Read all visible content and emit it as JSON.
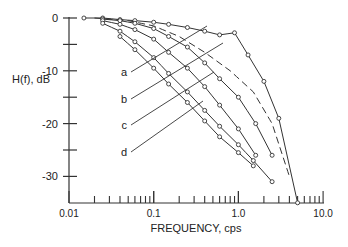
{
  "chart_data": {
    "type": "line",
    "title": "",
    "xlabel": "FREQUENCY, cps",
    "ylabel": "H(f), dB",
    "xscale": "log",
    "xlim": [
      0.01,
      10.0
    ],
    "ylim": [
      -35,
      0
    ],
    "x_ticks": [
      "0.01",
      "0.1",
      "1.0",
      "10.0"
    ],
    "y_ticks": [
      "0",
      "-10",
      "-20",
      "-30"
    ],
    "grid": false,
    "legend": "curve labels a, b, c, d with leader lines",
    "series": [
      {
        "name": "top (solid, peak near 1.0)",
        "style": "solid-markers",
        "x": [
          0.015,
          0.025,
          0.04,
          0.06,
          0.1,
          0.15,
          0.25,
          0.4,
          0.6,
          0.9,
          1.3,
          2.0,
          3.0,
          5.0
        ],
        "y": [
          0,
          0,
          -0.3,
          -0.5,
          -0.8,
          -1.2,
          -1.8,
          -2.5,
          -3.2,
          -2.8,
          -7,
          -12,
          -19,
          -35
        ]
      },
      {
        "name": "dashed",
        "style": "dashed",
        "x": [
          0.02,
          0.05,
          0.1,
          0.2,
          0.4,
          0.8,
          1.5,
          2.5,
          4.0
        ],
        "y": [
          0,
          -0.5,
          -1.5,
          -3.5,
          -6.5,
          -10,
          -14,
          -20,
          -30
        ]
      },
      {
        "name": "a",
        "style": "solid-markers",
        "x": [
          0.025,
          0.04,
          0.06,
          0.1,
          0.15,
          0.25,
          0.4,
          0.6,
          1.0,
          1.6,
          2.5
        ],
        "y": [
          -0.2,
          -0.5,
          -1,
          -2,
          -3.5,
          -5.5,
          -8.5,
          -11.5,
          -15,
          -20,
          -26
        ]
      },
      {
        "name": "b",
        "style": "solid-markers",
        "x": [
          0.025,
          0.04,
          0.06,
          0.1,
          0.15,
          0.25,
          0.4,
          0.6,
          1.0,
          1.6
        ],
        "y": [
          -0.5,
          -1.2,
          -2.2,
          -4,
          -6.5,
          -9.5,
          -13,
          -16.5,
          -21,
          -26
        ]
      },
      {
        "name": "c",
        "style": "solid-markers",
        "x": [
          0.025,
          0.04,
          0.06,
          0.1,
          0.15,
          0.25,
          0.4,
          0.6,
          1.0,
          1.5,
          2.5
        ],
        "y": [
          -1,
          -2.5,
          -4.5,
          -7.5,
          -10.5,
          -14,
          -17.5,
          -20.5,
          -24,
          -27,
          -31
        ]
      },
      {
        "name": "d",
        "style": "solid-markers",
        "x": [
          0.04,
          0.06,
          0.1,
          0.15,
          0.25,
          0.4,
          0.6,
          1.0,
          1.5
        ],
        "y": [
          -3.5,
          -6,
          -9.5,
          -12.5,
          -16,
          -19.5,
          -22.5,
          -25.5,
          -28
        ]
      }
    ],
    "annotations": [
      "a",
      "b",
      "c",
      "d"
    ]
  }
}
